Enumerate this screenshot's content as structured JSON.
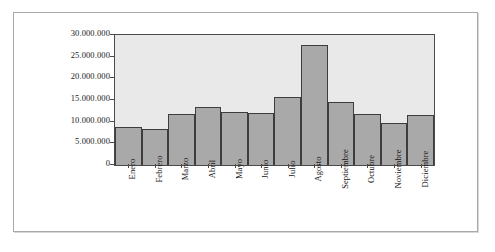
{
  "chart_data": {
    "type": "bar",
    "title": "",
    "subtitle": "",
    "xlabel": "",
    "ylabel": "",
    "grid": false,
    "legend": false,
    "legend_position": "none",
    "ylim": [
      0,
      30000000
    ],
    "y_ticks": [
      0,
      5000000,
      10000000,
      15000000,
      20000000,
      25000000,
      30000000
    ],
    "y_tick_labels": [
      "0",
      "5.000.000",
      "10.000.000",
      "15.000.000",
      "20.000.000",
      "25.000.000",
      "30.000.000"
    ],
    "categories": [
      "Enero",
      "Febrero",
      "Marzo",
      "Abril",
      "Mayo",
      "Junio",
      "Julio",
      "Agosto",
      "Septiembre",
      "Octubre",
      "Noviembre",
      "Diciembre"
    ],
    "values": [
      8800000,
      8300000,
      11800000,
      13500000,
      12200000,
      11900000,
      15600000,
      27800000,
      14600000,
      11800000,
      9800000,
      11500000
    ],
    "colors": {
      "bar_fill": "#a9a9a9",
      "bar_border": "#3d3d3d",
      "plot_background": "#e9e9e9",
      "axis": "#4a4a4a",
      "frame_border": "#a9a9a9",
      "page_background": "#ffffff",
      "text": "#111111"
    }
  }
}
